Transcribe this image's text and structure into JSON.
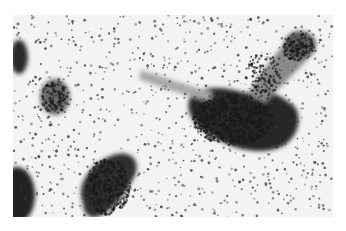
{
  "image": {
    "kind": "grayscale micrograph",
    "description": "Scattered small dark particles on light background with several dense dark clusters",
    "border_color": "#ffffff",
    "background_color": "#f2f2f2",
    "particle_color": "#3a3a3a",
    "cluster_color": "#1e1e1e"
  }
}
